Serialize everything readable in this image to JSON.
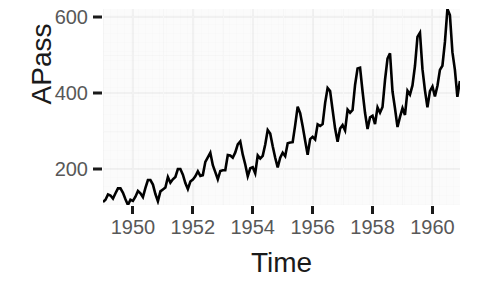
{
  "chart_data": {
    "type": "line",
    "title": "",
    "subtitle": "",
    "xlabel": "Time",
    "ylabel": "APass",
    "xlim": [
      1949.0,
      1960.92
    ],
    "ylim": [
      104,
      622
    ],
    "xticks": [
      1950,
      1952,
      1954,
      1956,
      1958,
      1960
    ],
    "xtick_labels": [
      "1950",
      "1952",
      "1954",
      "1956",
      "1958",
      "1960"
    ],
    "yticks": [
      200,
      400,
      600
    ],
    "ytick_labels": [
      "200",
      "400",
      "600"
    ],
    "grid": true,
    "legend": "none",
    "series_color": "#000000",
    "panel_background": "#fbfbfb",
    "gridline_color": "#f1f1f1",
    "axis_text_color": "#585858",
    "axis_title_color": "#1a1a1a",
    "series": [
      {
        "name": "APass",
        "x": [
          1949.0,
          1949.083,
          1949.167,
          1949.25,
          1949.333,
          1949.417,
          1949.5,
          1949.583,
          1949.667,
          1949.75,
          1949.833,
          1949.917,
          1950.0,
          1950.083,
          1950.167,
          1950.25,
          1950.333,
          1950.417,
          1950.5,
          1950.583,
          1950.667,
          1950.75,
          1950.833,
          1950.917,
          1951.0,
          1951.083,
          1951.167,
          1951.25,
          1951.333,
          1951.417,
          1951.5,
          1951.583,
          1951.667,
          1951.75,
          1951.833,
          1951.917,
          1952.0,
          1952.083,
          1952.167,
          1952.25,
          1952.333,
          1952.417,
          1952.5,
          1952.583,
          1952.667,
          1952.75,
          1952.833,
          1952.917,
          1953.0,
          1953.083,
          1953.167,
          1953.25,
          1953.333,
          1953.417,
          1953.5,
          1953.583,
          1953.667,
          1953.75,
          1953.833,
          1953.917,
          1954.0,
          1954.083,
          1954.167,
          1954.25,
          1954.333,
          1954.417,
          1954.5,
          1954.583,
          1954.667,
          1954.75,
          1954.833,
          1954.917,
          1955.0,
          1955.083,
          1955.167,
          1955.25,
          1955.333,
          1955.417,
          1955.5,
          1955.583,
          1955.667,
          1955.75,
          1955.833,
          1955.917,
          1956.0,
          1956.083,
          1956.167,
          1956.25,
          1956.333,
          1956.417,
          1956.5,
          1956.583,
          1956.667,
          1956.75,
          1956.833,
          1956.917,
          1957.0,
          1957.083,
          1957.167,
          1957.25,
          1957.333,
          1957.417,
          1957.5,
          1957.583,
          1957.667,
          1957.75,
          1957.833,
          1957.917,
          1958.0,
          1958.083,
          1958.167,
          1958.25,
          1958.333,
          1958.417,
          1958.5,
          1958.583,
          1958.667,
          1958.75,
          1958.833,
          1958.917,
          1959.0,
          1959.083,
          1959.167,
          1959.25,
          1959.333,
          1959.417,
          1959.5,
          1959.583,
          1959.667,
          1959.75,
          1959.833,
          1959.917,
          1960.0,
          1960.083,
          1960.167,
          1960.25,
          1960.333,
          1960.417,
          1960.5,
          1960.583,
          1960.667,
          1960.75,
          1960.833,
          1960.917
        ],
        "values": [
          112,
          118,
          132,
          129,
          121,
          135,
          148,
          148,
          136,
          119,
          104,
          118,
          115,
          126,
          141,
          135,
          125,
          149,
          170,
          170,
          158,
          133,
          114,
          140,
          145,
          150,
          178,
          163,
          172,
          178,
          199,
          199,
          184,
          162,
          146,
          166,
          171,
          180,
          193,
          181,
          183,
          218,
          230,
          242,
          209,
          191,
          172,
          194,
          196,
          196,
          236,
          235,
          229,
          243,
          264,
          272,
          237,
          211,
          180,
          201,
          204,
          188,
          235,
          227,
          234,
          264,
          302,
          293,
          259,
          229,
          203,
          229,
          242,
          233,
          267,
          269,
          270,
          315,
          364,
          347,
          312,
          274,
          237,
          278,
          284,
          277,
          317,
          313,
          318,
          374,
          413,
          405,
          355,
          306,
          271,
          306,
          315,
          301,
          356,
          348,
          355,
          422,
          465,
          467,
          404,
          347,
          305,
          336,
          340,
          318,
          362,
          348,
          363,
          435,
          491,
          505,
          404,
          359,
          310,
          337,
          360,
          342,
          406,
          396,
          420,
          472,
          548,
          559,
          463,
          407,
          362,
          405,
          417,
          391,
          419,
          461,
          472,
          535,
          622,
          606,
          508,
          461,
          390,
          432
        ]
      }
    ]
  }
}
